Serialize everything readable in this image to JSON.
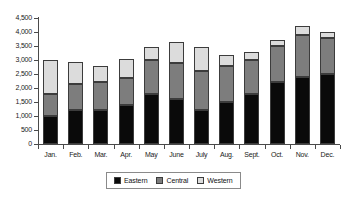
{
  "chart_data": {
    "type": "bar",
    "stacked": true,
    "title": "",
    "subtitle": "",
    "xlabel": "",
    "ylabel": "",
    "ylim": [
      0,
      4500
    ],
    "ytick_step": 500,
    "grid": false,
    "legend_position": "bottom",
    "categories": [
      "Jan.",
      "Feb.",
      "Mar.",
      "Apr.",
      "May",
      "June",
      "July",
      "Aug.",
      "Sept.",
      "Oct.",
      "Nov.",
      "Dec."
    ],
    "ytick_labels": [
      "4,500",
      "4,000",
      "3,500",
      "3,000",
      "2,500",
      "2,000",
      "1,500",
      "1,000",
      "500",
      "0"
    ],
    "ytick_values": [
      4500,
      4000,
      3500,
      3000,
      2500,
      2000,
      1500,
      1000,
      500,
      0
    ],
    "series": [
      {
        "name": "Eastern",
        "color": "#0a0a0a",
        "values": [
          1000,
          1200,
          1200,
          1400,
          1800,
          1600,
          1200,
          1500,
          1800,
          2200,
          2400,
          2500
        ]
      },
      {
        "name": "Central",
        "color": "#7d7d7d",
        "values": [
          800,
          950,
          1000,
          950,
          1200,
          1300,
          1400,
          1300,
          1200,
          1300,
          1500,
          1300
        ]
      },
      {
        "name": "Western",
        "color": "#dcdcdc",
        "values": [
          1200,
          780,
          600,
          670,
          450,
          750,
          870,
          380,
          300,
          200,
          300,
          200
        ]
      }
    ],
    "totals": [
      3000,
      2930,
      2800,
      3020,
      3450,
      3650,
      3470,
      3180,
      3300,
      3700,
      4200,
      4000
    ]
  },
  "legend": {
    "items": [
      {
        "label": "Eastern",
        "color": "#0a0a0a"
      },
      {
        "label": "Central",
        "color": "#7d7d7d"
      },
      {
        "label": "Western",
        "color": "#dcdcdc"
      }
    ]
  }
}
